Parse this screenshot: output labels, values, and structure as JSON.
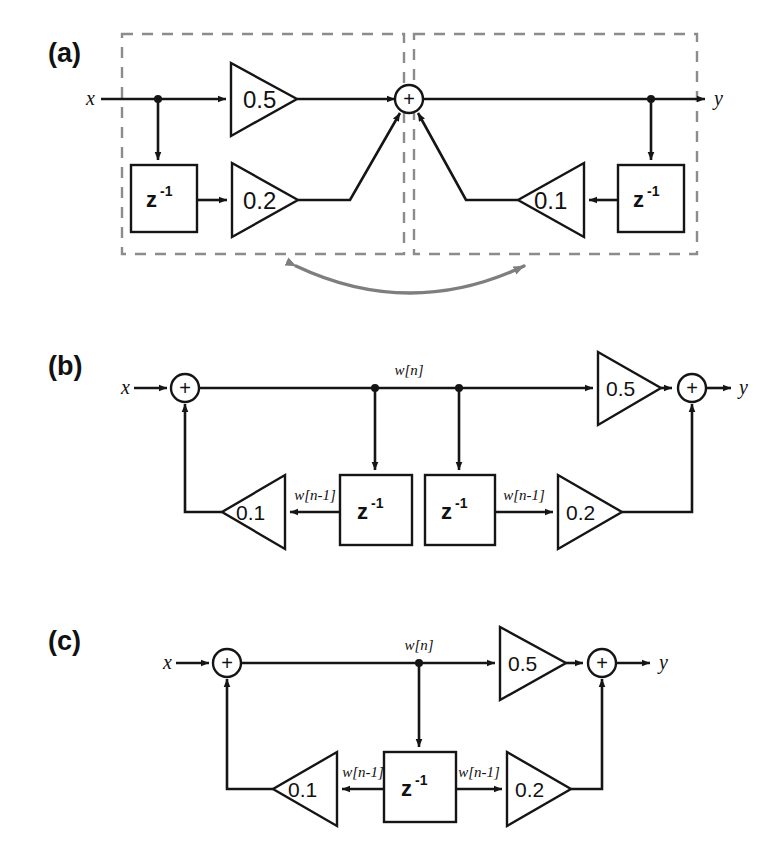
{
  "figure": {
    "type": "signal-flow-block-diagram",
    "panels": [
      {
        "id": "a",
        "label": "(a)",
        "input_label": "x",
        "output_label": "y",
        "sum_symbol": "+",
        "dashed_groups": 2,
        "gains": [
          "0.5",
          "0.2",
          "0.1"
        ],
        "delays": [
          "z",
          "-1",
          "z",
          "-1"
        ],
        "delay_base": "z",
        "delay_exponent": "-1",
        "annotation_arrow": "double-headed-curved-gray-arrow"
      },
      {
        "id": "b",
        "label": "(b)",
        "input_label": "x",
        "output_label": "y",
        "sum_symbol": "+",
        "gains": [
          "0.5",
          "0.1",
          "0.2"
        ],
        "delay_base": "z",
        "delay_exponent": "-1",
        "state_label": "w[n]",
        "delayed_state_label_left": "w[n-1]",
        "delayed_state_label_right": "w[n-1]",
        "delay_count": 2
      },
      {
        "id": "c",
        "label": "(c)",
        "input_label": "x",
        "output_label": "y",
        "sum_symbol": "+",
        "gains": [
          "0.5",
          "0.1",
          "0.2"
        ],
        "delay_base": "z",
        "delay_exponent": "-1",
        "state_label": "w[n]",
        "delayed_state_label_left": "w[n-1]",
        "delayed_state_label_right": "w[n-1]",
        "delay_count": 1
      }
    ]
  },
  "panel_a": {
    "label": "(a)",
    "input": "x",
    "output": "y",
    "sum": "+",
    "gain_feedforward": "0.5",
    "gain_delayed_input": "0.2",
    "gain_feedback": "0.1",
    "delay_left_base": "z",
    "delay_left_exp": "-1",
    "delay_right_base": "z",
    "delay_right_exp": "-1"
  },
  "panel_b": {
    "label": "(b)",
    "input": "x",
    "output": "y",
    "sum_in": "+",
    "sum_out": "+",
    "gain_forward": "0.5",
    "gain_feedback": "0.1",
    "gain_delayed": "0.2",
    "delay1_base": "z",
    "delay1_exp": "-1",
    "delay2_base": "z",
    "delay2_exp": "-1",
    "w_n": "w[n]",
    "w_n1_left": "w[n-1]",
    "w_n1_right": "w[n-1]"
  },
  "panel_c": {
    "label": "(c)",
    "input": "x",
    "output": "y",
    "sum_in": "+",
    "sum_out": "+",
    "gain_forward": "0.5",
    "gain_feedback": "0.1",
    "gain_delayed": "0.2",
    "delay_base": "z",
    "delay_exp": "-1",
    "w_n": "w[n]",
    "w_n1_left": "w[n-1]",
    "w_n1_right": "w[n-1]"
  },
  "colors": {
    "line": "#151515",
    "dashed_group": "#8c8c8c",
    "annotation_arrow": "#7e7e7e",
    "background": "#ffffff"
  }
}
